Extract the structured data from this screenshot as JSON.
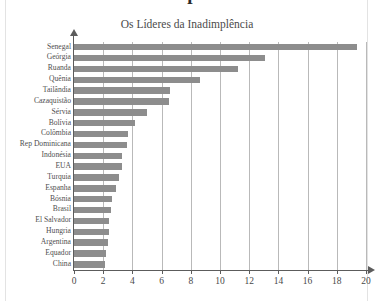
{
  "page": {
    "partial_heading_above": "Inadimplência"
  },
  "chart_data": {
    "type": "bar",
    "orientation": "horizontal",
    "title": "Os Líderes da Inadimplência",
    "subtitle": "",
    "xlabel": "",
    "ylabel": "",
    "xlim": [
      0,
      20
    ],
    "ylim": null,
    "grid": true,
    "legend": false,
    "legend_position": "none",
    "xticks": [
      0,
      2,
      4,
      6,
      8,
      10,
      12,
      14,
      16,
      18,
      20
    ],
    "xtick_labels": [
      "0",
      "2",
      "4",
      "6",
      "8",
      "10",
      "12",
      "14",
      "16",
      "18",
      "20"
    ],
    "bar_color": "#8d8d8d",
    "axis_color": "#5c5c5c",
    "grid_color": "#b9b9b9",
    "categories": [
      "Senegal",
      "Geórgia",
      "Ruanda",
      "Quênia",
      "Tailândia",
      "Cazaquistão",
      "Sérvia",
      "Bolívia",
      "Colômbia",
      "Rep Dominicana",
      "Indonésia",
      "EUA",
      "Turquia",
      "Espanha",
      "Bósnia",
      "Brasil",
      "El Salvador",
      "Hungria",
      "Argentina",
      "Equador",
      "China"
    ],
    "values": [
      19.4,
      13.1,
      11.2,
      8.6,
      6.6,
      6.5,
      5.0,
      4.2,
      3.7,
      3.6,
      3.3,
      3.3,
      3.1,
      2.9,
      2.6,
      2.5,
      2.4,
      2.4,
      2.3,
      2.2,
      2.1
    ]
  }
}
